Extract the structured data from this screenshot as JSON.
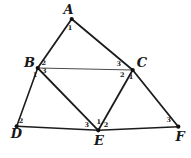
{
  "figure": {
    "background_color": "#ffffff",
    "stroke_color": "#1c1c1c",
    "dot_color": "#111111",
    "dot_radius": 2.1,
    "points": [
      {
        "id": "A",
        "label": "A",
        "x": 71.7,
        "y": 19.0,
        "label_x": 68.5,
        "label_y": 9.5
      },
      {
        "id": "B",
        "label": "B",
        "x": 37.7,
        "y": 68.0,
        "label_x": 29.5,
        "label_y": 62.5
      },
      {
        "id": "C",
        "label": "C",
        "x": 132.7,
        "y": 70.0,
        "label_x": 142.0,
        "label_y": 62.0
      },
      {
        "id": "D",
        "label": "D",
        "x": 16.7,
        "y": 126.3,
        "label_x": 16.5,
        "label_y": 133.5
      },
      {
        "id": "E",
        "label": "E",
        "x": 98.3,
        "y": 130.3,
        "label_x": 99.0,
        "label_y": 140.0
      },
      {
        "id": "F",
        "label": "F",
        "x": 178.3,
        "y": 126.7,
        "label_x": 180.0,
        "label_y": 136.0
      }
    ],
    "edges": [
      {
        "from": "A",
        "to": "B",
        "width": 1.8
      },
      {
        "from": "A",
        "to": "C",
        "width": 1.8
      },
      {
        "from": "B",
        "to": "C",
        "width": 0.8
      },
      {
        "from": "B",
        "to": "D",
        "width": 1.6
      },
      {
        "from": "B",
        "to": "E",
        "width": 1.8
      },
      {
        "from": "C",
        "to": "E",
        "width": 1.8
      },
      {
        "from": "C",
        "to": "F",
        "width": 1.8
      },
      {
        "from": "D",
        "to": "E",
        "width": 1.5
      },
      {
        "from": "E",
        "to": "F",
        "width": 1.5
      }
    ],
    "angle_labels": [
      {
        "at": "A",
        "text": "1",
        "x": 70.0,
        "y": 27.5
      },
      {
        "at": "B",
        "text": "2",
        "x": 43.7,
        "y": 63.0
      },
      {
        "at": "B",
        "text": "3",
        "x": 44.3,
        "y": 71.0
      },
      {
        "at": "B",
        "text": "1",
        "x": 35.0,
        "y": 75.0
      },
      {
        "at": "C",
        "text": "3",
        "x": 118.7,
        "y": 63.5
      },
      {
        "at": "C",
        "text": "2",
        "x": 122.3,
        "y": 75.0
      },
      {
        "at": "C",
        "text": "1",
        "x": 131.0,
        "y": 76.5
      },
      {
        "at": "D",
        "text": "2",
        "x": 21.0,
        "y": 121.0
      },
      {
        "at": "E",
        "text": "3",
        "x": 86.7,
        "y": 125.0
      },
      {
        "at": "E",
        "text": "1",
        "x": 98.7,
        "y": 122.0
      },
      {
        "at": "E",
        "text": "2",
        "x": 106.0,
        "y": 124.5
      },
      {
        "at": "F",
        "text": "3",
        "x": 168.7,
        "y": 120.0
      }
    ]
  }
}
